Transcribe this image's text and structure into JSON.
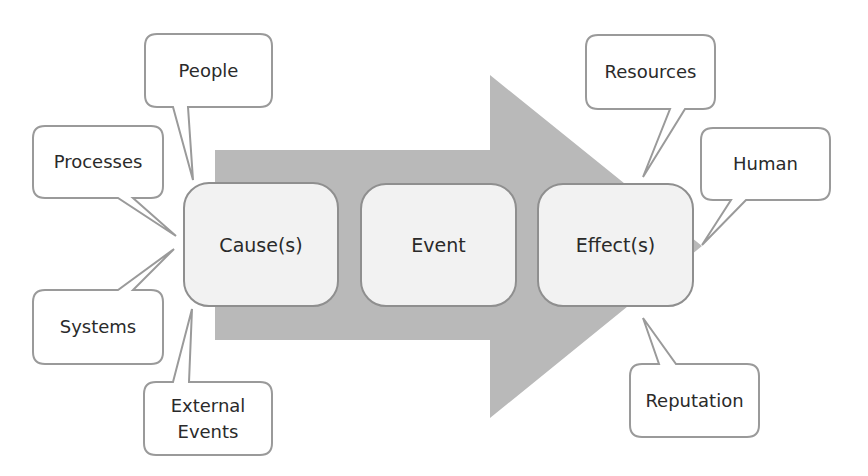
{
  "diagram": {
    "colors": {
      "arrow_fill": "#b9b9b9",
      "box_fill": "#f2f2f2",
      "box_stroke": "#8f8f8f",
      "callout_fill": "#ffffff",
      "callout_stroke": "#9a9a9a",
      "text": "#2a2a2a"
    },
    "stages": [
      {
        "label": "Cause(s)"
      },
      {
        "label": "Event"
      },
      {
        "label": "Effect(s)"
      }
    ],
    "causes": [
      {
        "label": "People"
      },
      {
        "label": "Processes"
      },
      {
        "label": "Systems"
      },
      {
        "label": "External\nEvents"
      }
    ],
    "effects": [
      {
        "label": "Resources"
      },
      {
        "label": "Human"
      },
      {
        "label": "Reputation"
      }
    ]
  }
}
